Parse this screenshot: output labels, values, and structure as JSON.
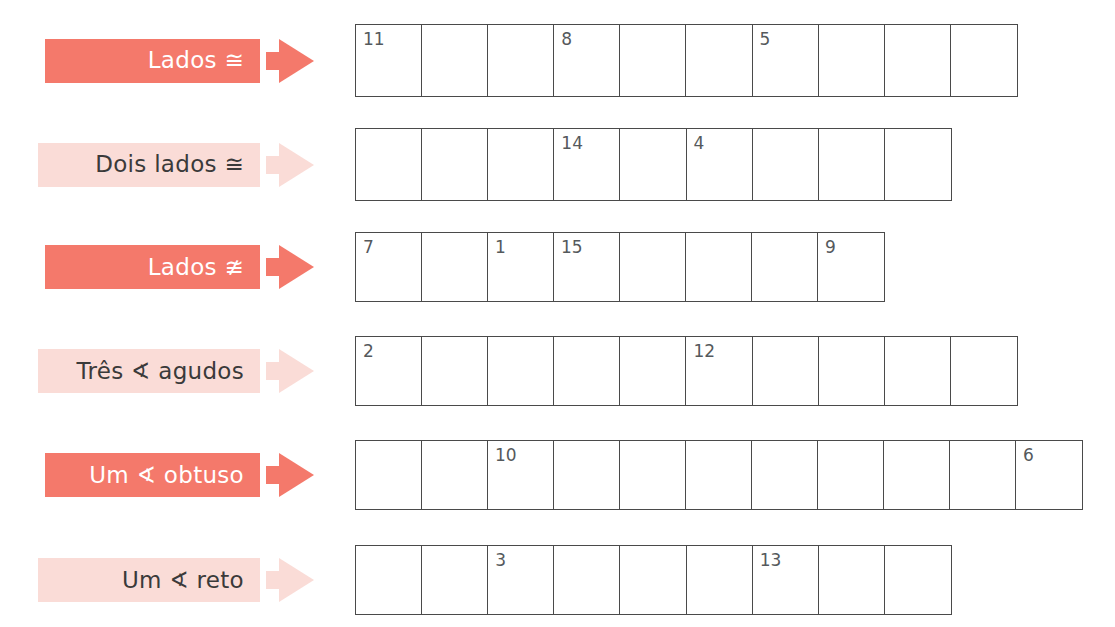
{
  "worksheet": {
    "title": "Classificacao de triangulos - tabela de respostas",
    "colors": {
      "strong": "#F4796B",
      "soft": "#FADCD7",
      "grid_line": "#4a4a4a",
      "value_text": "#55595c",
      "strong_text": "#ffffff",
      "soft_text": "#3a3a3a"
    }
  },
  "rows": [
    {
      "label": "Lados ≅",
      "tone": "strong",
      "top": 24,
      "bar_left": 45,
      "bar_width": 215,
      "grid_left": 355,
      "grid_width": 663,
      "grid_height": 73,
      "cell_count": 10,
      "cells": [
        "11",
        "",
        "",
        "8",
        "",
        "",
        "5",
        "",
        "",
        ""
      ]
    },
    {
      "label": "Dois lados ≅",
      "tone": "soft",
      "top": 128,
      "bar_left": 38,
      "bar_width": 222,
      "grid_left": 355,
      "grid_width": 597,
      "grid_height": 73,
      "cell_count": 9,
      "cells": [
        "",
        "",
        "",
        "14",
        "",
        "4",
        "",
        "",
        ""
      ]
    },
    {
      "label": "Lados ≇",
      "tone": "strong",
      "top": 232,
      "bar_left": 45,
      "bar_width": 215,
      "grid_left": 355,
      "grid_width": 530,
      "grid_height": 70,
      "cell_count": 8,
      "cells": [
        "7",
        "",
        "1",
        "15",
        "",
        "",
        "",
        "9"
      ]
    },
    {
      "label": "Três ∢ agudos",
      "tone": "soft",
      "top": 336,
      "bar_left": 38,
      "bar_width": 222,
      "grid_left": 355,
      "grid_width": 663,
      "grid_height": 70,
      "cell_count": 10,
      "cells": [
        "2",
        "",
        "",
        "",
        "",
        "12",
        "",
        "",
        "",
        ""
      ]
    },
    {
      "label": "Um ∢ obtuso",
      "tone": "strong",
      "top": 440,
      "bar_left": 45,
      "bar_width": 215,
      "grid_left": 355,
      "grid_width": 728,
      "grid_height": 70,
      "cell_count": 11,
      "cells": [
        "",
        "",
        "10",
        "",
        "",
        "",
        "",
        "",
        "",
        "",
        "6"
      ]
    },
    {
      "label": "Um ∢ reto",
      "tone": "soft",
      "top": 545,
      "bar_left": 38,
      "bar_width": 222,
      "grid_left": 355,
      "grid_width": 597,
      "grid_height": 70,
      "cell_count": 9,
      "cells": [
        "",
        "",
        "3",
        "",
        "",
        "",
        "13",
        "",
        ""
      ]
    }
  ]
}
